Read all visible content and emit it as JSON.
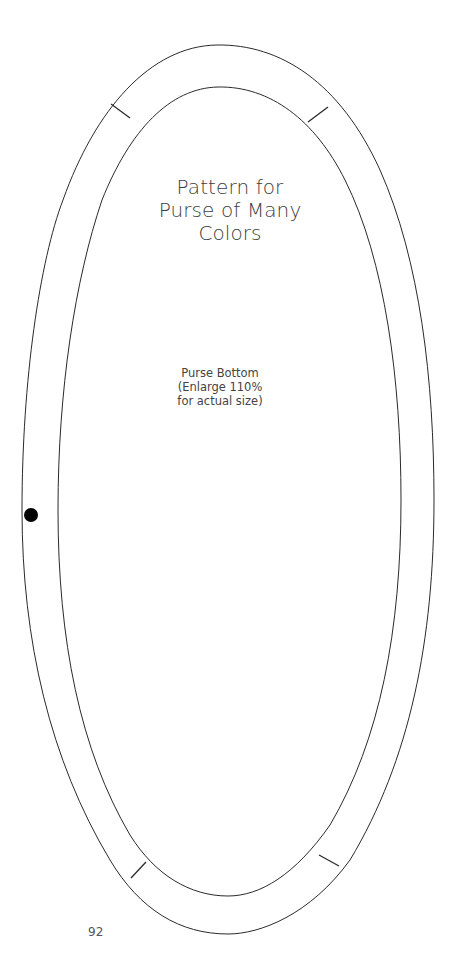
{
  "title": {
    "lines": [
      "Pattern for",
      "Purse of Many",
      "Colors"
    ]
  },
  "label": {
    "lines": [
      "Purse Bottom",
      "(Enlarge 110%",
      "for actual size)"
    ]
  },
  "page_number": "92",
  "colors": {
    "line": "#2a2a2a",
    "text": "#3c3c3c",
    "dot": "#000000",
    "background": "#ffffff"
  },
  "icons": {
    "placement_dot": "filled-circle"
  }
}
